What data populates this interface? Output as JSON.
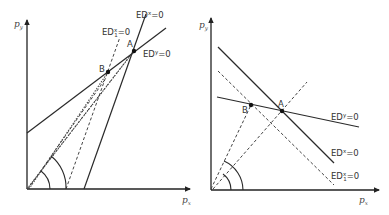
{
  "left_panel": {
    "y_axis_label": "p",
    "y_axis_sub": "y",
    "x_axis_label": "p",
    "x_axis_sub": "x",
    "curves": [
      {
        "id": "EDx",
        "label_main": "ED",
        "label_sup": "x",
        "label_tail": "=0",
        "style": "solid"
      },
      {
        "id": "EDy",
        "label_main": "ED",
        "label_sup": "y",
        "label_tail": "=0",
        "style": "solid"
      },
      {
        "id": "EDx1",
        "label_main": "ED",
        "label_sup": "x",
        "label_sub": "1",
        "label_tail": "=0",
        "style": "dashed"
      }
    ],
    "points": [
      {
        "name": "A"
      },
      {
        "name": "B"
      }
    ]
  },
  "right_panel": {
    "y_axis_label": "p",
    "y_axis_sub": "y",
    "x_axis_label": "p",
    "x_axis_sub": "x",
    "curves": [
      {
        "id": "EDy",
        "label_main": "ED",
        "label_sup": "y",
        "label_tail": "=0",
        "style": "solid"
      },
      {
        "id": "EDx",
        "label_main": "ED",
        "label_sup": "x",
        "label_tail": "=0",
        "style": "solid"
      },
      {
        "id": "EDx1",
        "label_main": "ED",
        "label_sup": "x",
        "label_sub": "1",
        "label_tail": "=0",
        "style": "dashed"
      }
    ],
    "points": [
      {
        "name": "A"
      },
      {
        "name": "B"
      }
    ]
  }
}
